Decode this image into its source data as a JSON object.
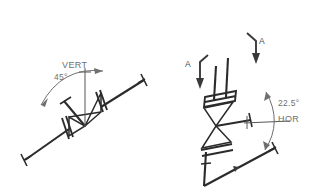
{
  "page": {
    "background_color": "#ffffff",
    "line_color": "#2b2b2b",
    "text_color": "#6f6f6f",
    "width": 316,
    "height": 193
  },
  "left_detail": {
    "name": "valve-45-from-vertical",
    "reference_label": "VERT",
    "angle_label": "45°",
    "reference_axis": "vertical",
    "valve_symbol": "butterfly-valve-bowtie",
    "flange_count": 2,
    "pipe_orientation": "diagonal-rising-right"
  },
  "right_detail": {
    "name": "valve-22-5-from-horizontal",
    "reference_label": "HOR",
    "angle_label": "22.5°",
    "reference_axis": "horizontal",
    "valve_symbol": "butterfly-valve-bowtie",
    "flange_count": 2,
    "pipe_orientation": "near-vertical",
    "section_marks": [
      {
        "label": "A",
        "position": "left"
      },
      {
        "label": "A",
        "position": "right"
      }
    ]
  }
}
